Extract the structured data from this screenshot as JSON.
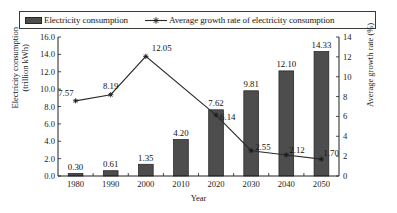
{
  "legend": {
    "bar_label": "Electricity consumption",
    "line_label": "Average growth rate of electricity consumption",
    "bar_swatch_icon": "filled-rect-icon",
    "line_swatch_icon": "line-with-star-marker-icon"
  },
  "axes": {
    "y_left_title": "Electricity consumption (trillion kWh)",
    "y_left_title_line1": "Electricity consumption",
    "y_left_title_line2": "(trillion kWh)",
    "y_right_title": "Average growth rate (%)",
    "x_title": "Year",
    "y_left_ticks": [
      "0.0",
      "2.0",
      "4.0",
      "6.0",
      "8.0",
      "10.0",
      "12.0",
      "14.0",
      "16.0"
    ],
    "y_right_ticks": [
      "0",
      "2",
      "4",
      "6",
      "8",
      "10",
      "12",
      "14"
    ],
    "x_ticks": [
      "1980",
      "1990",
      "2000",
      "2010",
      "2020",
      "2030",
      "2040",
      "2050"
    ]
  },
  "chart_data": {
    "type": "bar",
    "title": "",
    "xlabel": "Year",
    "ylabel": "Electricity consumption (trillion kWh)",
    "y2label": "Average growth rate (%)",
    "categories": [
      "1980",
      "1990",
      "2000",
      "2010",
      "2020",
      "2030",
      "2040",
      "2050"
    ],
    "ylim": [
      0,
      16
    ],
    "y2lim": [
      0,
      14
    ],
    "grid": false,
    "legend_position": "top",
    "series": [
      {
        "name": "Electricity consumption",
        "type": "bar",
        "axis": "left",
        "unit": "trillion kWh",
        "color": "#4d4d4d",
        "values": [
          0.3,
          0.61,
          1.35,
          4.2,
          7.62,
          9.81,
          12.1,
          14.33
        ],
        "labels": [
          "0.30",
          "0.61",
          "1.35",
          "4.20",
          "7.62",
          "9.81",
          "12.10",
          "14.33"
        ]
      },
      {
        "name": "Average growth rate of electricity consumption",
        "type": "line",
        "axis": "right",
        "unit": "%",
        "color": "#2b2b2b",
        "marker": "star",
        "values": [
          7.57,
          8.19,
          12.05,
          null,
          6.14,
          2.55,
          2.12,
          1.7
        ],
        "labels": [
          "7.57",
          "8.19",
          "12.05",
          "",
          "6.14",
          "2.55",
          "2.12",
          "1.70"
        ]
      }
    ]
  }
}
